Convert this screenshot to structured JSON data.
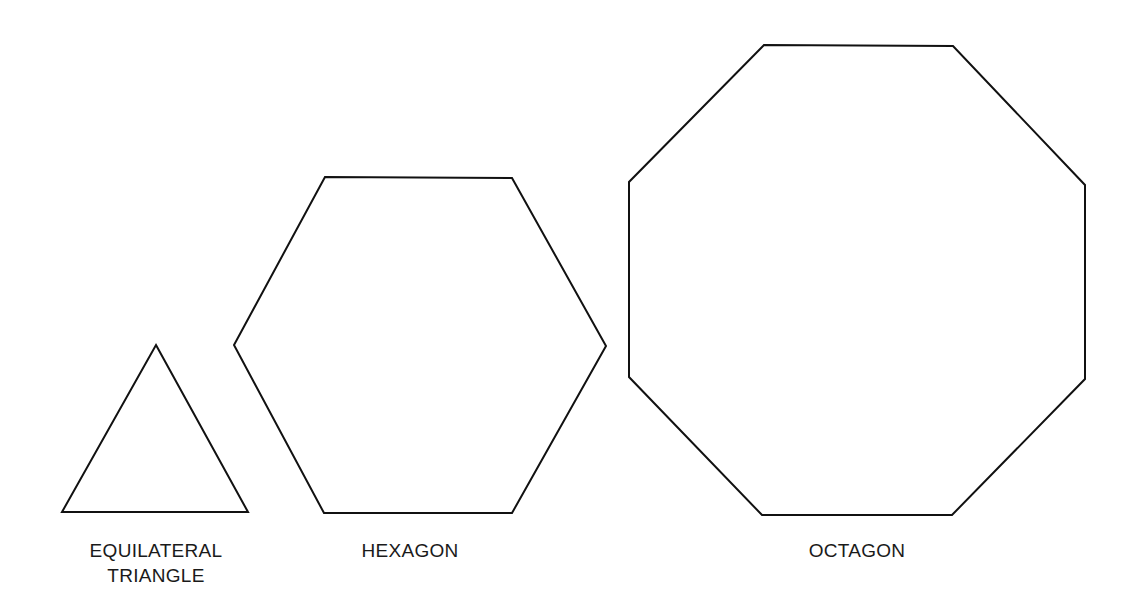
{
  "canvas": {
    "width": 1141,
    "height": 613,
    "background": "#ffffff",
    "stroke_color": "#111111"
  },
  "shapes": [
    {
      "name": "equilateral-triangle",
      "sides": 3,
      "points": "156,345 248,512 62,512",
      "label_lines": [
        "EQUILATERAL",
        "TRIANGLE"
      ],
      "label_x": 156,
      "label_y": [
        557,
        582
      ]
    },
    {
      "name": "hexagon",
      "sides": 6,
      "points": "325,177 512,178 606,346 512,513 324,513 234,345",
      "label_lines": [
        "HEXAGON"
      ],
      "label_x": 410,
      "label_y": [
        557
      ]
    },
    {
      "name": "octagon",
      "sides": 8,
      "points": "764,45 953,46 1085,185 1085,379 952,515 762,515 629,377 629,182",
      "label_lines": [
        "OCTAGON"
      ],
      "label_x": 857,
      "label_y": [
        557
      ]
    }
  ]
}
